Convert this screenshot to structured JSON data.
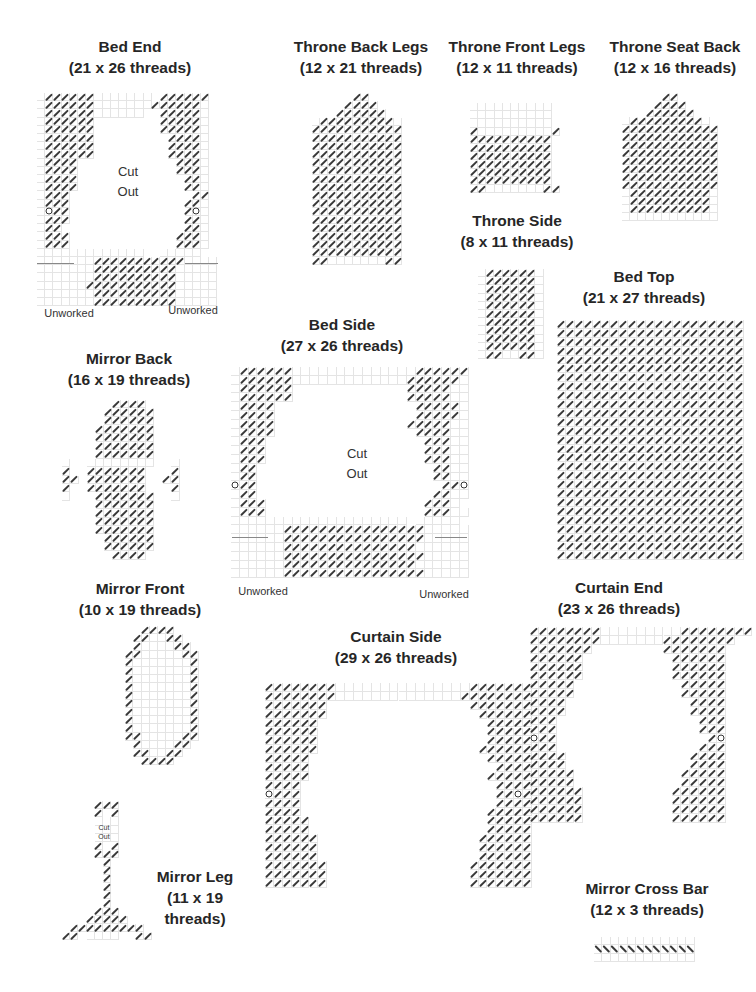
{
  "pieces": [
    {
      "id": "bed-end",
      "title": "Bed End",
      "subtitle": "(21 x 26 threads)",
      "title_x": 130,
      "title_y": 36,
      "grid_x": 37,
      "grid_y": 93,
      "cell": 8.2,
      "rows": [
        ".//////....... //////",
        ".//////.......//////.",
        ".//////......  /////.",
        ".//////        /////.",
        ".//////        /////.",
        ".//////         ////.",
        ".//////         ////.",
        ".//////         ////.",
        ".////            ///.",
        ".////            ///.",
        ".////             //.",
        ".////             //.",
        ".///               //",
        ".///              //.",
        ".o//              /o.",
        ".///              //.",
        ".//               //.",
        ".///             ///.",
        ".///             ///.",
        ".............  .....",
        ".......///////////....",
        ".......//////////.....",
        ".......//////////.....",
        "......///////////.....",
        ".......//////////.....",
        ".......//////////....."
      ],
      "notes": [
        {
          "text": "Cut",
          "x": 128,
          "y": 163,
          "size": "normal"
        },
        {
          "text": "Out",
          "x": 128,
          "y": 183,
          "size": "normal"
        },
        {
          "text": "Unworked",
          "x": 69,
          "y": 304,
          "size": "unw"
        },
        {
          "text": "Unworked",
          "x": 193,
          "y": 301,
          "size": "unw"
        }
      ],
      "hlines": [
        {
          "x": 37,
          "y": 263,
          "w": 37
        },
        {
          "x": 185,
          "y": 263,
          "w": 33
        }
      ]
    },
    {
      "id": "throne-back-legs",
      "title": "Throne Back Legs",
      "subtitle": "(12 x 21 threads)",
      "title_x": 361,
      "title_y": 36,
      "grid_x": 312,
      "grid_y": 93,
      "cell": 8.2,
      "rows": [
        "     //     ",
        "    ////    ",
        "   //////   ",
        "./////////.",
        "///////////",
        "///////////",
        "///////////",
        "///////////",
        "///////////",
        "///////////",
        "///////////",
        "///////////",
        "///////////",
        "///////////",
        "///////////",
        "///////////",
        "///////////",
        "///////////",
        "///////////",
        "///////////",
        "//.......//"
      ],
      "notes": [],
      "hlines": []
    },
    {
      "id": "throne-front-legs",
      "title": "Throne Front Legs",
      "subtitle": "(12 x 11 threads)",
      "title_x": 517,
      "title_y": 36,
      "grid_x": 470,
      "grid_y": 103,
      "cell": 8.2,
      "rows": [
        "..........",
        "..........",
        "..........",
        "/........./",
        "//////////",
        "//////////",
        "//////////",
        "//////////",
        "//////////",
        "//////////",
        "//.......//"
      ],
      "notes": [],
      "hlines": []
    },
    {
      "id": "throne-seat-back",
      "title": "Throne Seat Back",
      "subtitle": "(12 x 16 threads)",
      "title_x": 675,
      "title_y": 36,
      "grid_x": 622,
      "grid_y": 93,
      "cell": 8.0,
      "rows": [
        "     //     ",
        "    ////    ",
        "   //////   ",
        "./////////.",
        "////////////",
        "////////////",
        "////////////",
        "////////////",
        "////////////",
        "////////////",
        "////////////",
        "////////////",
        ".//////////.",
        ".//////////.",
        ".//////////.",
        "............"
      ],
      "notes": [],
      "hlines": []
    },
    {
      "id": "throne-side",
      "title": "Throne Side",
      "subtitle": "(8 x 11 threads)",
      "title_x": 517,
      "title_y": 210,
      "grid_x": 478,
      "grid_y": 269,
      "cell": 8.2,
      "rows": [
        ".//////.",
        ".//////.",
        ".//////.",
        ".//////.",
        ".//////.",
        ".//////.",
        ".//////.",
        ".//////.",
        ".//////.",
        ".//////.",
        ".//..//."
      ],
      "notes": [],
      "hlines": []
    },
    {
      "id": "bed-top",
      "title": "Bed Top",
      "subtitle": "(21 x 27 threads)",
      "title_x": 644,
      "title_y": 266,
      "grid_x": 557,
      "grid_y": 320,
      "cell": 8.9,
      "rows": [
        "/////////////////////",
        "/////////////////////",
        "/////////////////////",
        "/////////////////////",
        "/////////////////////",
        "/////////////////////",
        "/////////////////////",
        "/////////////////////",
        "/////////////////////",
        "/////////////////////",
        "/////////////////////",
        "/////////////////////",
        "/////////////////////",
        "/////////////////////",
        "/////////////////////",
        "/////////////////////",
        "/////////////////////",
        "/////////////////////",
        "/////////////////////",
        "/////////////////////",
        "/////////////////////",
        "/////////////////////",
        "/////////////////////",
        "/////////////////////",
        "/////////////////////",
        "/////////////////////",
        "/////////////////////"
      ],
      "notes": [],
      "hlines": []
    },
    {
      "id": "bed-side",
      "title": "Bed Side",
      "subtitle": "(27 x 26 threads)",
      "title_x": 342,
      "title_y": 314,
      "grid_x": 231,
      "grid_y": 367,
      "cell": 8.8,
      "rows": [
        ".//////..............//////",
        ".//////.............//////.",
        ".//////             /////..",
        ".//////             /////..",
        ".////                /////.",
        ".////                /////.",
        ".////               /////..",
        ".////                ////..",
        ".///                  ///..",
        ".///                  ///..",
        ".///                  ///..",
        ".//                    //..",
        ".//                    //..",
        "o//                     //o",
        ".//                    //..",
        ".///                  ///.",
        ".///                  ///..",
        ".................... .....",
        "......////////////////.....",
        "......////////////////.....",
        "......///////////////......",
        "......////////////////.....",
        "......///////////////......",
        "......////////////////....."
      ],
      "notes": [
        {
          "text": "Cut",
          "x": 357,
          "y": 445,
          "size": "normal"
        },
        {
          "text": "Out",
          "x": 357,
          "y": 465,
          "size": "normal"
        },
        {
          "text": "Unworked",
          "x": 263,
          "y": 582,
          "size": "unw"
        },
        {
          "text": "Unworked",
          "x": 444,
          "y": 585,
          "size": "unw"
        }
      ],
      "hlines": [
        {
          "x": 232,
          "y": 537,
          "w": 36
        },
        {
          "x": 435,
          "y": 537,
          "w": 32
        }
      ]
    },
    {
      "id": "mirror-back",
      "title": "Mirror Back",
      "subtitle": "(16 x 19 threads)",
      "title_x": 129,
      "title_y": 348,
      "grid_x": 62,
      "grid_y": 400,
      "cell": 8.4,
      "rows": [
        "      ////      ",
        "     //////     ",
        "     //////     ",
        "    ///////     ",
        "    ///////     ",
        "    ///////     ",
        "    ///////     ",
        ".  ........  .",
        "/  ///////   /",
        "// ///////  //",
        "/  ///////   /",
        ".   ///////  .",
        "    ///////     ",
        "    ///////     ",
        "    ///////     ",
        "    ///////     ",
        "     //////     ",
        "     //////     ",
        "      ////      "
      ],
      "notes": [],
      "hlines": []
    },
    {
      "id": "mirror-front",
      "title": "Mirror Front",
      "subtitle": "(10 x 19 threads)",
      "title_x": 140,
      "title_y": 578,
      "grid_x": 117,
      "grid_y": 626,
      "cell": 8.2,
      "rows": [
        "   ////   ",
        "  //..//  ",
        "  /....// ",
        " //.....//",
        " /......./",
        " /......./",
        " /......./",
        " /......./",
        " /......./",
        " /......./",
        " /......./",
        " /......./",
        " /......./",
        " //.....//",
        "  /....// ",
        "  //..//  ",
        "   ////   "
      ],
      "notes": [],
      "hlines": []
    },
    {
      "id": "mirror-leg",
      "title": "Mirror Leg",
      "subtitle": "(11 x 19 threads)",
      "title_x": 195,
      "title_y": 866,
      "grid_x": 62,
      "grid_y": 801,
      "cell": 8.2,
      "rows": [
        "    ///    ",
        "    / /    ",
        "    ...    ",
        "    ...    ",
        "    ...    ",
        "    / /    ",
        "    ///    ",
        "     /     ",
        "     /     ",
        "     /     ",
        "     /     ",
        "     /     ",
        "     /     ",
        "    ///    ",
        "   /////   ",
        " ///////// ",
        "// ....  //"
      ],
      "notes": [
        {
          "text": "Cut",
          "x": 104,
          "y": 823,
          "size": "small"
        },
        {
          "text": "Out",
          "x": 104,
          "y": 832,
          "size": "small"
        }
      ],
      "hlines": [],
      "title_lines": [
        "Mirror Leg",
        "(11 x 19",
        "threads)"
      ]
    },
    {
      "id": "curtain-side",
      "title": "Curtain Side",
      "subtitle": "(29 x 26 threads)",
      "title_x": 396,
      "title_y": 626,
      "grid_x": 265,
      "grid_y": 683,
      "cell": 8.9,
      "rows": [
        "////////...............///////",
        "////////..............////////",
        "///////                ///////",
        "///////                 //////",
        "//////                   /////",
        "//////                   /////",
        "//////                   /////",
        "//////                  //////",
        "/////                    /////",
        "/////                     ////",
        "/////                    /////",
        "////                      ////",
        "o///                      //o/",
        "////                      ////",
        "////                     /////",
        "/////                    /////",
        "/////                    /////",
        "//////                  //////",
        "//////                  //////",
        "//////                  //////",
        "///////                ///////",
        "///////                ///////",
        "///////                ///////"
      ],
      "notes": [],
      "hlines": []
    },
    {
      "id": "curtain-end",
      "title": "Curtain End",
      "subtitle": "(23 x 26 threads)",
      "title_x": 619,
      "title_y": 577,
      "grid_x": 530,
      "grid_y": 627,
      "cell": 8.9,
      "rows": [
        "////////.........////////",
        "////////.......////////",
        "///////        ///////",
        "//////          //////",
        "//////          //////",
        "//////          //////",
        "/////            /////",
        "/////            /////",
        "////              ////",
        "////              ////",
        "///                ///",
        "///                ///",
        "o//                 /o",
        "///                ///",
        "////              ////",
        "////              ////",
        "/////            /////",
        "/////            /////",
        "//////          //////",
        "//////          //////",
        "//////          //////",
        "//////          //////"
      ],
      "notes": [],
      "hlines": []
    },
    {
      "id": "mirror-cross-bar",
      "title": "Mirror Cross Bar",
      "subtitle": "(12 x 3 threads)",
      "title_x": 647,
      "title_y": 878,
      "grid_x": 594,
      "grid_y": 937,
      "cell": 8.4,
      "rows": [
        "............",
        "\\\\\\\\\\\\\\\\\\\\\\\\",
        "............"
      ],
      "notes": [],
      "hlines": []
    }
  ]
}
